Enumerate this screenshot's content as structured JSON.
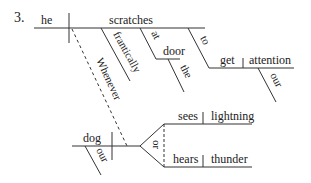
{
  "problem_number": "3.",
  "clause_main": {
    "subject": "he",
    "verb": "scratches",
    "modifiers": {
      "adverb": "frantically",
      "preposition": "at",
      "prep_object": "door",
      "prep_object_article": "the",
      "infinitive_marker": "to",
      "infinitive_verb": "get",
      "infinitive_object": "attention",
      "object_possessive": "our"
    }
  },
  "subordinate_conjunction": "Whenever",
  "clause_sub": {
    "subject": "dog",
    "subject_possessive": "our",
    "conjunction": "or",
    "predicates": [
      {
        "verb": "sees",
        "object": "lightning"
      },
      {
        "verb": "hears",
        "object": "thunder"
      }
    ]
  },
  "colors": {
    "line": "#333333",
    "text": "#222222"
  }
}
